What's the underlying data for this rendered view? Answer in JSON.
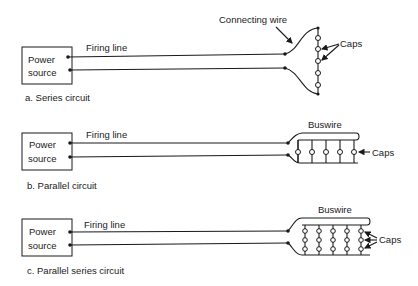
{
  "diagrams": [
    {
      "id": "a",
      "caption": "a.  Series circuit",
      "source_label_line1": "Power",
      "source_label_line2": "source",
      "firing_line_label": "Firing line",
      "connecting_wire_label": "Connecting wire",
      "caps_label": "Caps"
    },
    {
      "id": "b",
      "caption": "b.  Parallel circuit",
      "source_label_line1": "Power",
      "source_label_line2": "source",
      "firing_line_label": "Firing line",
      "buswire_label": "Buswire",
      "caps_label": "Caps"
    },
    {
      "id": "c",
      "caption": "c.  Parallel series circuit",
      "source_label_line1": "Power",
      "source_label_line2": "source",
      "firing_line_label": "Firing line",
      "buswire_label": "Buswire",
      "caps_label": "Caps"
    }
  ],
  "colors": {
    "ink": "#1a1a1a",
    "background": "#ffffff"
  }
}
